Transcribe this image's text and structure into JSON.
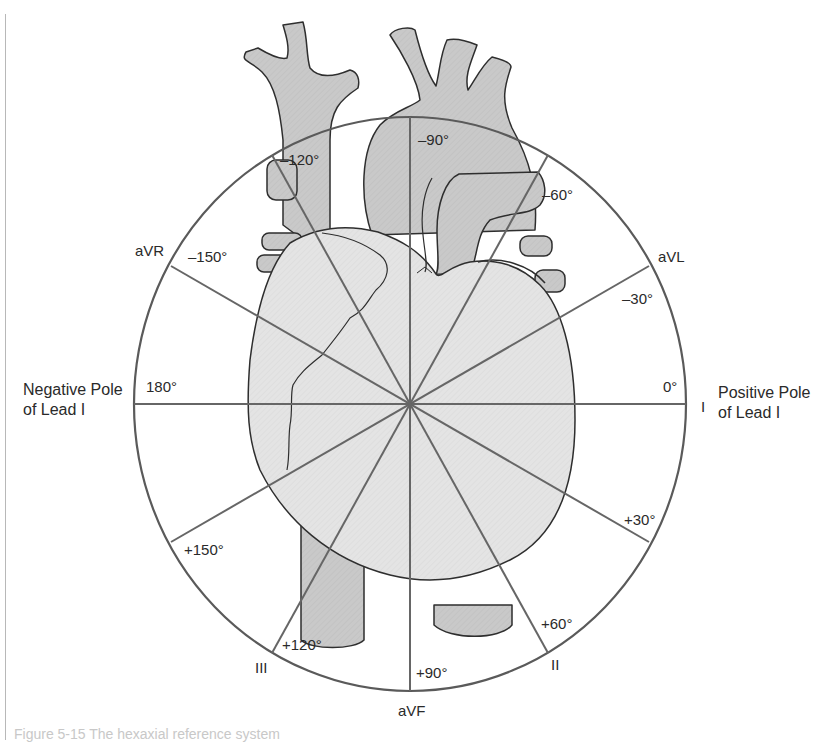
{
  "diagram": {
    "type": "hexaxial-reference-system",
    "axes": [
      {
        "angle": 0,
        "label": "0°",
        "lead": "I"
      },
      {
        "angle": 30,
        "label": "+30°",
        "lead": ""
      },
      {
        "angle": 60,
        "label": "+60°",
        "lead": "II"
      },
      {
        "angle": 90,
        "label": "+90°",
        "lead": "aVF"
      },
      {
        "angle": 120,
        "label": "+120°",
        "lead": "III"
      },
      {
        "angle": 150,
        "label": "+150°",
        "lead": ""
      },
      {
        "angle": 180,
        "label": "180°",
        "lead": ""
      },
      {
        "angle": -150,
        "label": "–150°",
        "lead": "aVR"
      },
      {
        "angle": -120,
        "label": "–120°",
        "lead": ""
      },
      {
        "angle": -90,
        "label": "–90°",
        "lead": ""
      },
      {
        "angle": -60,
        "label": "–60°",
        "lead": ""
      },
      {
        "angle": -30,
        "label": "–30°",
        "lead": "aVL"
      }
    ],
    "labels": {
      "deg_0": "0°",
      "deg_p30": "+30°",
      "deg_p60": "+60°",
      "deg_p90": "+90°",
      "deg_p120": "+120°",
      "deg_p150": "+150°",
      "deg_180": "180°",
      "deg_m150": "–150°",
      "deg_m120": "–120°",
      "deg_m90": "–90°",
      "deg_m60": "–60°",
      "deg_m30": "–30°",
      "lead_I": "I",
      "lead_II": "II",
      "lead_III": "III",
      "lead_aVR": "aVR",
      "lead_aVL": "aVL",
      "lead_aVF": "aVF"
    },
    "positive_pole": {
      "line1": "Positive Pole",
      "line2": "of Lead I"
    },
    "negative_pole": {
      "line1": "Negative Pole",
      "line2": "of Lead I"
    },
    "caption": "Figure 5-15  The hexaxial reference system",
    "colors": {
      "circle": "#5a5a5a",
      "axis": "#666666",
      "vessel_fill": "#c9c9c9",
      "heart_fill": "#e4e4e4",
      "outline": "#2e2e2e",
      "text": "#2a2a2a"
    }
  }
}
